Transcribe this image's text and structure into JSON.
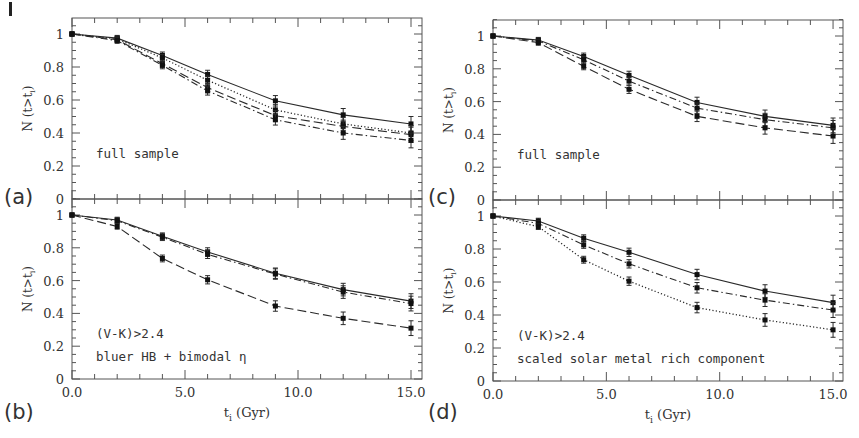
{
  "figure": {
    "panel_labels": [
      "(a)",
      "(b)",
      "(c)",
      "(d)"
    ],
    "xlabel": "t_i (Gyr)",
    "ylabel": "N (t>t_i)"
  },
  "chart_data": [
    {
      "type": "line",
      "panel": "(a)",
      "annotation": [
        "full sample"
      ],
      "x": [
        0,
        2,
        4,
        6,
        9,
        12,
        15
      ],
      "xlim": [
        0,
        15.5
      ],
      "ylim": [
        0,
        1.1
      ],
      "xticks": [],
      "yticks": [
        "0",
        "0.2",
        "0.4",
        "0.6",
        "0.8",
        "1"
      ],
      "ylabel": "N (t>t_i)",
      "xlabel": "",
      "series": [
        {
          "name": "solid",
          "style": "solid",
          "values": [
            1.0,
            0.975,
            0.87,
            0.755,
            0.595,
            0.51,
            0.455
          ]
        },
        {
          "name": "dotted",
          "style": "dotted",
          "values": [
            1.0,
            0.97,
            0.855,
            0.72,
            0.54,
            0.455,
            0.4
          ]
        },
        {
          "name": "dashed",
          "style": "dashed",
          "values": [
            1.0,
            0.965,
            0.82,
            0.675,
            0.505,
            0.44,
            0.39
          ]
        },
        {
          "name": "dash-dot",
          "style": "dashdot",
          "values": [
            1.0,
            0.96,
            0.81,
            0.655,
            0.48,
            0.4,
            0.355
          ]
        }
      ]
    },
    {
      "type": "line",
      "panel": "(b)",
      "annotation": [
        "(V-K)>2.4",
        "bluer HB + bimodal η"
      ],
      "x": [
        0,
        2,
        4,
        6,
        9,
        12,
        15
      ],
      "xlim": [
        0,
        15.5
      ],
      "ylim": [
        0,
        1.1
      ],
      "xticks": [
        "0.0",
        "5.0",
        "10.0",
        "15.0"
      ],
      "yticks": [
        "0",
        "0.2",
        "0.4",
        "0.6",
        "0.8",
        "1"
      ],
      "ylabel": "N (t>t_i)",
      "xlabel": "t_i (Gyr)",
      "series": [
        {
          "name": "solid",
          "style": "solid",
          "values": [
            1.0,
            0.97,
            0.87,
            0.775,
            0.645,
            0.545,
            0.475
          ]
        },
        {
          "name": "dash-dot",
          "style": "dashdot",
          "values": [
            1.0,
            0.965,
            0.865,
            0.76,
            0.64,
            0.53,
            0.46
          ]
        },
        {
          "name": "dashed",
          "style": "dashed",
          "values": [
            1.0,
            0.93,
            0.735,
            0.605,
            0.445,
            0.37,
            0.31
          ]
        }
      ]
    },
    {
      "type": "line",
      "panel": "(c)",
      "annotation": [
        "full sample"
      ],
      "x": [
        0,
        2,
        4,
        6,
        9,
        12,
        15
      ],
      "xlim": [
        0,
        15.5
      ],
      "ylim": [
        0,
        1.1
      ],
      "xticks": [],
      "yticks": [
        "0",
        "0.2",
        "0.4",
        "0.6",
        "0.8",
        "1"
      ],
      "ylabel": "N (t>t_i)",
      "xlabel": "",
      "series": [
        {
          "name": "solid",
          "style": "solid",
          "values": [
            1.0,
            0.975,
            0.875,
            0.76,
            0.595,
            0.51,
            0.455
          ]
        },
        {
          "name": "dash-dot",
          "style": "dashdot",
          "values": [
            1.0,
            0.97,
            0.855,
            0.725,
            0.56,
            0.49,
            0.44
          ]
        },
        {
          "name": "dashed",
          "style": "dashed",
          "values": [
            1.0,
            0.96,
            0.815,
            0.675,
            0.51,
            0.44,
            0.39
          ]
        }
      ]
    },
    {
      "type": "line",
      "panel": "(d)",
      "annotation": [
        "(V-K)>2.4",
        "scaled solar metal rich component"
      ],
      "x": [
        0,
        2,
        4,
        6,
        9,
        12,
        15
      ],
      "xlim": [
        0,
        15.5
      ],
      "ylim": [
        0,
        1.1
      ],
      "xticks": [
        "0.0",
        "5.0",
        "10.0",
        "15.0"
      ],
      "yticks": [
        "0",
        "0.2",
        "0.4",
        "0.6",
        "0.8",
        "1"
      ],
      "ylabel": "N (t>t_i)",
      "xlabel": "t_i (Gyr)",
      "series": [
        {
          "name": "solid",
          "style": "solid",
          "values": [
            1.0,
            0.97,
            0.865,
            0.78,
            0.645,
            0.545,
            0.475
          ]
        },
        {
          "name": "dash-dot",
          "style": "dashdot",
          "values": [
            1.0,
            0.955,
            0.825,
            0.71,
            0.565,
            0.49,
            0.43
          ]
        },
        {
          "name": "dotted",
          "style": "dotted",
          "values": [
            1.0,
            0.935,
            0.735,
            0.605,
            0.445,
            0.37,
            0.31
          ]
        }
      ]
    }
  ]
}
